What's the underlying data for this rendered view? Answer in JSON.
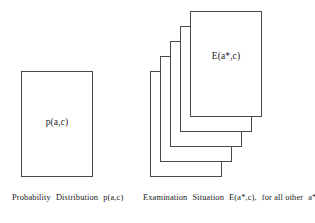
{
  "figure": {
    "background_color": "#ffffff",
    "stroke_color": "#4a4a4a",
    "text_color": "#1a1a1a",
    "left_group": {
      "name": "probability-distribution",
      "sheet_label": "p(a,c)",
      "caption": "Probability Distribution  p(a,c)",
      "caption_parts": {
        "lead": "Probability",
        "middle": "Distribution",
        "symbol": "p(a,c)"
      },
      "sheet_count": 1
    },
    "right_group": {
      "name": "examination-situation",
      "sheet_label": "E(a*,c)",
      "caption": "Examination Situation  E(a*,c),  for all other  a*",
      "caption_parts": {
        "lead": "Examination",
        "middle": "Situation",
        "symbol": "E(a*,c),",
        "qualifier": "for all other",
        "variable": "a*"
      },
      "sheet_count": 5,
      "sheets": [
        {
          "id": "exam-sheet-1",
          "label": ""
        },
        {
          "id": "exam-sheet-2",
          "label": ""
        },
        {
          "id": "exam-sheet-3",
          "label": ""
        },
        {
          "id": "exam-sheet-4",
          "label": ""
        },
        {
          "id": "exam-sheet-5",
          "label": "E(a*,c)"
        }
      ]
    }
  }
}
